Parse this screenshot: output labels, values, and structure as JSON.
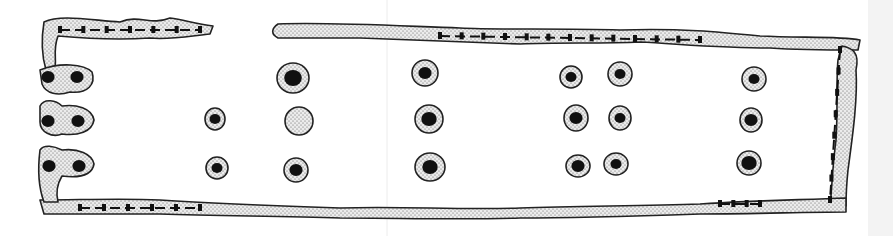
{
  "figure": {
    "type": "archaeological-site-plan",
    "width": 893,
    "height": 236,
    "colors": {
      "fill_stipple": "#e9e9e9",
      "stipple_dot": "#555555",
      "outline": "#222222",
      "post": "#111111",
      "background": "#ffffff"
    },
    "walls": [
      {
        "id": "north-wall-west",
        "d": "M44,22 C60,14 90,20 120,22 C140,14 150,26 170,18 C185,20 195,24 213,26 L210,34 C190,36 170,40 150,38 C120,40 80,38 58,36 C52,52 58,62 54,70 L46,70 C40,50 42,34 44,22 Z"
      },
      {
        "id": "north-wall-main",
        "d": "M278,24 C330,22 400,26 460,28 C500,30 560,28 620,30 C680,28 720,32 760,36 C800,38 840,36 860,40 L858,50 C830,50 800,50 770,48 C720,48 680,44 640,42 C600,44 560,42 520,44 C460,42 420,40 360,38 C320,38 300,38 278,38 C270,34 272,28 278,24 Z"
      },
      {
        "id": "east-wall",
        "d": "M842,46 C852,48 860,52 856,70 C858,100 852,140 848,170 C846,190 846,200 846,206 L830,206 C832,190 832,170 836,140 C838,110 836,80 838,60 Z"
      },
      {
        "id": "south-wall",
        "d": "M40,200 C80,200 120,198 160,200 C220,204 280,206 340,208 C400,206 460,210 520,208 C580,206 640,206 700,204 C760,200 800,200 846,198 L846,212 C800,212 760,214 700,214 C640,216 580,218 520,218 C460,220 400,218 340,218 C280,216 220,216 160,214 C120,214 80,214 44,214 Z"
      },
      {
        "id": "west-end-post-1",
        "d": "M40,70 C60,62 84,64 92,72 C96,84 88,94 70,92 C58,96 46,94 42,84 Z"
      },
      {
        "id": "west-end-post-2",
        "d": "M40,106 C44,98 56,100 62,106 C76,104 92,108 94,120 C92,132 78,136 62,134 C52,138 40,132 40,122 Z"
      },
      {
        "id": "west-end-post-3",
        "d": "M40,150 C44,144 54,146 62,150 C78,148 92,154 94,164 C92,176 78,178 62,176 C56,186 56,194 58,202 L44,202 C38,186 38,166 40,150 Z"
      }
    ],
    "wall_trench_segments": [
      {
        "x1": 60,
        "y1": 30,
        "x2": 200,
        "y2": 30
      },
      {
        "x1": 440,
        "y1": 36,
        "x2": 700,
        "y2": 40
      },
      {
        "x1": 840,
        "y1": 50,
        "x2": 830,
        "y2": 200
      },
      {
        "x1": 80,
        "y1": 208,
        "x2": 200,
        "y2": 208
      },
      {
        "x1": 720,
        "y1": 204,
        "x2": 760,
        "y2": 204
      }
    ],
    "post_holes": [
      {
        "id": "ph-1",
        "cx": 48,
        "cy": 77,
        "rx": 0,
        "ry": 0,
        "pr": 6
      },
      {
        "id": "ph-2",
        "cx": 77,
        "cy": 77,
        "rx": 0,
        "ry": 0,
        "pr": 6
      },
      {
        "id": "ph-3",
        "cx": 48,
        "cy": 121,
        "rx": 0,
        "ry": 0,
        "pr": 6
      },
      {
        "id": "ph-4",
        "cx": 78,
        "cy": 121,
        "rx": 0,
        "ry": 0,
        "pr": 6
      },
      {
        "id": "ph-5",
        "cx": 49,
        "cy": 166,
        "rx": 0,
        "ry": 0,
        "pr": 6
      },
      {
        "id": "ph-6",
        "cx": 79,
        "cy": 166,
        "rx": 0,
        "ry": 0,
        "pr": 6
      },
      {
        "id": "ph-7",
        "cx": 215,
        "cy": 119,
        "rx": 10,
        "ry": 11,
        "pr": 5
      },
      {
        "id": "ph-8",
        "cx": 217,
        "cy": 168,
        "rx": 11,
        "ry": 11,
        "pr": 5
      },
      {
        "id": "ph-9",
        "cx": 293,
        "cy": 78,
        "rx": 16,
        "ry": 15,
        "pr": 8
      },
      {
        "id": "ph-10",
        "cx": 299,
        "cy": 121,
        "rx": 14,
        "ry": 14,
        "pr": 0
      },
      {
        "id": "ph-11",
        "cx": 296,
        "cy": 170,
        "rx": 12,
        "ry": 12,
        "pr": 6
      },
      {
        "id": "ph-12",
        "cx": 425,
        "cy": 73,
        "rx": 13,
        "ry": 13,
        "pr": 6
      },
      {
        "id": "ph-13",
        "cx": 429,
        "cy": 119,
        "rx": 14,
        "ry": 14,
        "pr": 7
      },
      {
        "id": "ph-14",
        "cx": 430,
        "cy": 167,
        "rx": 15,
        "ry": 14,
        "pr": 7
      },
      {
        "id": "ph-15",
        "cx": 571,
        "cy": 77,
        "rx": 11,
        "ry": 11,
        "pr": 5
      },
      {
        "id": "ph-16",
        "cx": 576,
        "cy": 118,
        "rx": 12,
        "ry": 13,
        "pr": 6
      },
      {
        "id": "ph-17",
        "cx": 578,
        "cy": 166,
        "rx": 12,
        "ry": 11,
        "pr": 6
      },
      {
        "id": "ph-18",
        "cx": 620,
        "cy": 74,
        "rx": 12,
        "ry": 12,
        "pr": 5
      },
      {
        "id": "ph-19",
        "cx": 620,
        "cy": 118,
        "rx": 11,
        "ry": 12,
        "pr": 5
      },
      {
        "id": "ph-20",
        "cx": 616,
        "cy": 164,
        "rx": 12,
        "ry": 11,
        "pr": 5
      },
      {
        "id": "ph-21",
        "cx": 754,
        "cy": 79,
        "rx": 12,
        "ry": 12,
        "pr": 5
      },
      {
        "id": "ph-22",
        "cx": 751,
        "cy": 120,
        "rx": 11,
        "ry": 12,
        "pr": 6
      },
      {
        "id": "ph-23",
        "cx": 749,
        "cy": 163,
        "rx": 12,
        "ry": 12,
        "pr": 7
      }
    ],
    "entrance_gap": {
      "x_start": 213,
      "x_end": 278,
      "side": "north"
    }
  }
}
